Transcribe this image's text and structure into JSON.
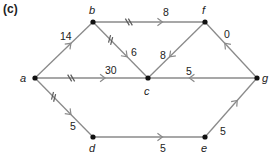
{
  "title": "(c)",
  "colors": {
    "edge": "#8a8a8a",
    "node": "#111111",
    "text": "#222222"
  },
  "nodes": [
    {
      "id": "a",
      "label": "a",
      "x": 35,
      "y": 78,
      "lx": 20,
      "ly": 82
    },
    {
      "id": "b",
      "label": "b",
      "x": 93,
      "y": 22,
      "lx": 89,
      "ly": 14
    },
    {
      "id": "c",
      "label": "c",
      "x": 148,
      "y": 78,
      "lx": 144,
      "ly": 95
    },
    {
      "id": "f",
      "label": "f",
      "x": 205,
      "y": 22,
      "lx": 202,
      "ly": 14
    },
    {
      "id": "g",
      "label": "g",
      "x": 257,
      "y": 78,
      "lx": 262,
      "ly": 82
    },
    {
      "id": "d",
      "label": "d",
      "x": 93,
      "y": 137,
      "lx": 89,
      "ly": 152
    },
    {
      "id": "e",
      "label": "e",
      "x": 205,
      "y": 137,
      "lx": 201,
      "ly": 152
    }
  ],
  "edges": [
    {
      "from": "a",
      "to": "b",
      "weight": "14",
      "ticks": 0,
      "lx": 60,
      "ly": 40
    },
    {
      "from": "b",
      "to": "f",
      "weight": "8",
      "ticks": 2,
      "lx": 163,
      "ly": 16
    },
    {
      "from": "b",
      "to": "c",
      "weight": "6",
      "ticks": 2,
      "lx": 131,
      "ly": 56
    },
    {
      "from": "f",
      "to": "c",
      "weight": "8",
      "ticks": 0,
      "lx": 160,
      "ly": 59
    },
    {
      "from": "g",
      "to": "f",
      "weight": "0",
      "ticks": 0,
      "lx": 224,
      "ly": 38
    },
    {
      "from": "a",
      "to": "c",
      "weight": "30",
      "ticks": 2,
      "lx": 105,
      "ly": 74
    },
    {
      "from": "g",
      "to": "c",
      "weight": "5",
      "ticks": 0,
      "lx": 186,
      "ly": 75
    },
    {
      "from": "a",
      "to": "d",
      "weight": "5",
      "ticks": 2,
      "lx": 70,
      "ly": 130
    },
    {
      "from": "d",
      "to": "e",
      "weight": "5",
      "ticks": 0,
      "lx": 160,
      "ly": 152
    },
    {
      "from": "e",
      "to": "g",
      "weight": "5",
      "ticks": 0,
      "lx": 220,
      "ly": 135
    }
  ]
}
